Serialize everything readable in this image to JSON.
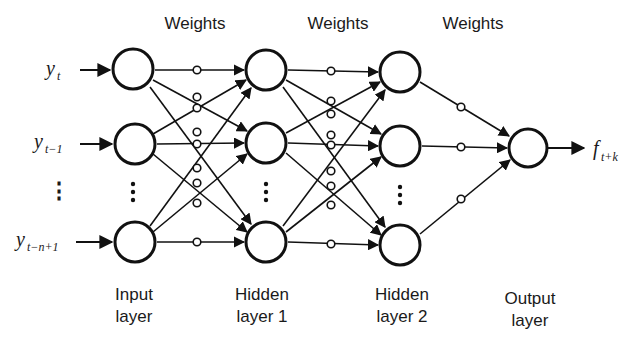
{
  "diagram": {
    "type": "feedforward-neural-network",
    "weight_labels": [
      "Weights",
      "Weights",
      "Weights"
    ],
    "inputs": [
      {
        "base": "y",
        "sub": "t"
      },
      {
        "base": "y",
        "sub": "t−1"
      },
      {
        "base": "y",
        "sub": "t−n+1"
      }
    ],
    "output": {
      "base": "f",
      "sub": "t+k"
    },
    "layers": [
      {
        "line1": "Input",
        "line2": "layer"
      },
      {
        "line1": "Hidden",
        "line2": "layer 1"
      },
      {
        "line1": "Hidden",
        "line2": "layer 2"
      },
      {
        "line1": "Output",
        "line2": "layer"
      }
    ],
    "ellipsis": "⋮",
    "colors": {
      "stroke": "#111111",
      "background": "#ffffff"
    }
  }
}
